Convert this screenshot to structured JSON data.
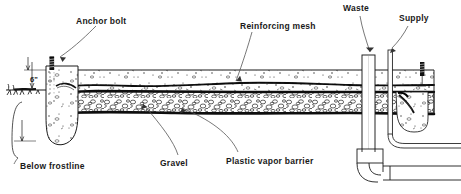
{
  "figure": {
    "kind": "construction-cross-section",
    "ink_color": "#1a1a1a",
    "paper_color": "#ffffff"
  },
  "labels": [
    {
      "id": "anchor-bolt",
      "text": "Anchor bolt",
      "x": 76,
      "y": 17
    },
    {
      "id": "reinforcing-mesh",
      "text": "Reinforcing mesh",
      "x": 240,
      "y": 22
    },
    {
      "id": "waste",
      "text": "Waste",
      "x": 343,
      "y": 4
    },
    {
      "id": "supply",
      "text": "Supply",
      "x": 399,
      "y": 14
    },
    {
      "id": "below-frostline",
      "text": "Below frostline",
      "x": 20,
      "y": 162
    },
    {
      "id": "gravel",
      "text": "Gravel",
      "x": 160,
      "y": 159
    },
    {
      "id": "plastic-vapor-barrier",
      "text": "Plastic vapor barrier",
      "x": 226,
      "y": 157
    }
  ],
  "dimensions": [
    {
      "id": "slab-edge-height",
      "text": "6\"",
      "x": 30,
      "y": 76
    }
  ],
  "components": [
    {
      "id": "concrete-slab",
      "name": "Concrete slab"
    },
    {
      "id": "gravel-base",
      "name": "Gravel base course"
    },
    {
      "id": "vapor-barrier-sheet",
      "name": "Plastic vapor barrier sheet"
    },
    {
      "id": "mesh-wire",
      "name": "Reinforcing wire mesh"
    },
    {
      "id": "thickened-edge-footing",
      "name": "Thickened edge footing"
    },
    {
      "id": "anchor-bolt-stud",
      "name": "Anchor bolt"
    },
    {
      "id": "grade-line",
      "name": "Exterior grade line"
    },
    {
      "id": "waste-pipe",
      "name": "Waste stack"
    },
    {
      "id": "supply-pipe",
      "name": "Supply riser"
    },
    {
      "id": "drain-trap",
      "name": "Drain elbow and trap"
    },
    {
      "id": "stub-out",
      "name": "Pipe stub-out"
    }
  ]
}
